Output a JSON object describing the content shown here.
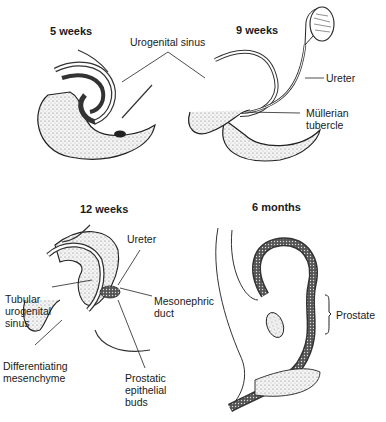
{
  "panels": [
    {
      "id": "5-weeks",
      "title": "5 weeks"
    },
    {
      "id": "9-weeks",
      "title": "9 weeks"
    },
    {
      "id": "12-weeks",
      "title": "12 weeks"
    },
    {
      "id": "6-months",
      "title": "6 months"
    }
  ],
  "labels": {
    "urogenital_sinus": "Urogenital sinus",
    "ureter_9w": "Ureter",
    "mullerian_tubercle_1": "Müllerian",
    "mullerian_tubercle_2": "tubercle",
    "ureter_12w": "Ureter",
    "tubular_1": "Tubular",
    "tubular_2": "urogenital",
    "tubular_3": "sinus",
    "mesonephric_1": "Mesonephric",
    "mesonephric_2": "duct",
    "differentiating_1": "Differentiating",
    "differentiating_2": "mesenchyme",
    "prostatic_1": "Prostatic",
    "prostatic_2": "epithelial",
    "prostatic_3": "buds",
    "prostate": "Prostate"
  }
}
